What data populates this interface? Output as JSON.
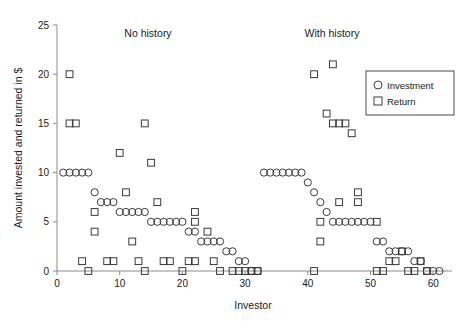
{
  "chart_data": {
    "type": "scatter",
    "title": "",
    "xlabel": "Investor",
    "ylabel": "Amount invested and returned in $",
    "xlim": [
      0,
      63
    ],
    "ylim": [
      0,
      25
    ],
    "xticks": [
      0,
      10,
      20,
      30,
      40,
      50,
      60
    ],
    "yticks": [
      0,
      5,
      10,
      15,
      20,
      25
    ],
    "grid": false,
    "legend_position": "upper right",
    "annotations": [
      {
        "text": "No history",
        "x": 14,
        "y": 24
      },
      {
        "text": "With history",
        "x": 45,
        "y": 24
      }
    ],
    "series": [
      {
        "name": "Investment",
        "marker": "circle",
        "color": "#3a3a3a",
        "points": [
          [
            1,
            10
          ],
          [
            2,
            10
          ],
          [
            3,
            10
          ],
          [
            4,
            10
          ],
          [
            5,
            10
          ],
          [
            6,
            8
          ],
          [
            7,
            7
          ],
          [
            8,
            7
          ],
          [
            9,
            7
          ],
          [
            10,
            6
          ],
          [
            11,
            6
          ],
          [
            12,
            6
          ],
          [
            13,
            6
          ],
          [
            14,
            6
          ],
          [
            15,
            5
          ],
          [
            16,
            5
          ],
          [
            17,
            5
          ],
          [
            18,
            5
          ],
          [
            19,
            5
          ],
          [
            20,
            5
          ],
          [
            21,
            4
          ],
          [
            22,
            4
          ],
          [
            23,
            3
          ],
          [
            24,
            3
          ],
          [
            25,
            3
          ],
          [
            26,
            3
          ],
          [
            27,
            2
          ],
          [
            28,
            2
          ],
          [
            29,
            1
          ],
          [
            30,
            1
          ],
          [
            31,
            0
          ],
          [
            32,
            0
          ],
          [
            33,
            10
          ],
          [
            34,
            10
          ],
          [
            35,
            10
          ],
          [
            36,
            10
          ],
          [
            37,
            10
          ],
          [
            38,
            10
          ],
          [
            39,
            10
          ],
          [
            40,
            9
          ],
          [
            41,
            8
          ],
          [
            42,
            7
          ],
          [
            43,
            6
          ],
          [
            44,
            5
          ],
          [
            45,
            5
          ],
          [
            46,
            5
          ],
          [
            47,
            5
          ],
          [
            48,
            5
          ],
          [
            49,
            5
          ],
          [
            50,
            5
          ],
          [
            51,
            3
          ],
          [
            52,
            3
          ],
          [
            53,
            2
          ],
          [
            54,
            2
          ],
          [
            55,
            2
          ],
          [
            56,
            2
          ],
          [
            57,
            1
          ],
          [
            58,
            1
          ],
          [
            59,
            0
          ],
          [
            60,
            0
          ],
          [
            61,
            0
          ]
        ]
      },
      {
        "name": "Return",
        "marker": "square",
        "color": "#3a3a3a",
        "points": [
          [
            2,
            20
          ],
          [
            2,
            15
          ],
          [
            3,
            15
          ],
          [
            4,
            1
          ],
          [
            5,
            0
          ],
          [
            6,
            6
          ],
          [
            6,
            4
          ],
          [
            8,
            1
          ],
          [
            9,
            1
          ],
          [
            10,
            12
          ],
          [
            11,
            8
          ],
          [
            12,
            3
          ],
          [
            13,
            1
          ],
          [
            14,
            0
          ],
          [
            14,
            15
          ],
          [
            15,
            11
          ],
          [
            16,
            7
          ],
          [
            17,
            1
          ],
          [
            18,
            1
          ],
          [
            20,
            0
          ],
          [
            21,
            1
          ],
          [
            22,
            1
          ],
          [
            22,
            6
          ],
          [
            22,
            5
          ],
          [
            24,
            4
          ],
          [
            25,
            1
          ],
          [
            26,
            0
          ],
          [
            28,
            0
          ],
          [
            29,
            0
          ],
          [
            30,
            0
          ],
          [
            31,
            0
          ],
          [
            32,
            0
          ],
          [
            41,
            20
          ],
          [
            41,
            0
          ],
          [
            42,
            3
          ],
          [
            42,
            5
          ],
          [
            43,
            16
          ],
          [
            44,
            15
          ],
          [
            45,
            15
          ],
          [
            46,
            15
          ],
          [
            44,
            21
          ],
          [
            45,
            7
          ],
          [
            47,
            14
          ],
          [
            48,
            8
          ],
          [
            48,
            7
          ],
          [
            51,
            5
          ],
          [
            51,
            0
          ],
          [
            52,
            0
          ],
          [
            53,
            1
          ],
          [
            54,
            1
          ],
          [
            55,
            2
          ],
          [
            56,
            0
          ],
          [
            57,
            0
          ],
          [
            58,
            1
          ],
          [
            59,
            0
          ]
        ]
      }
    ]
  },
  "axes": {
    "y_title": "Amount invested and returned in $",
    "x_title": "Investor",
    "y_ticks": [
      "0",
      "5",
      "10",
      "15",
      "20",
      "25"
    ],
    "x_ticks": [
      "0",
      "10",
      "20",
      "30",
      "40",
      "50",
      "60"
    ]
  },
  "group_labels": {
    "left": "No history",
    "right": "With history"
  },
  "legend": {
    "items": [
      {
        "label": "Investment",
        "marker": "circle-marker-icon"
      },
      {
        "label": "Return",
        "marker": "square-marker-icon"
      }
    ]
  }
}
